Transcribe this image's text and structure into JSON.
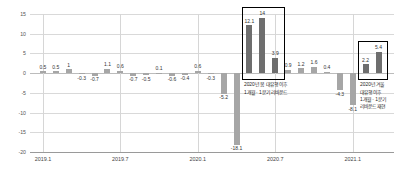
{
  "chart_data": {
    "type": "bar",
    "title": "",
    "subtitle": "",
    "xlabel": "",
    "ylabel": "",
    "ylim": [
      -20,
      15
    ],
    "yticks": [
      15,
      10,
      5,
      0,
      -5,
      -10,
      -15,
      -20
    ],
    "grid": true,
    "legend": false,
    "categories": [
      "2019.1",
      "2019.2",
      "2019.3",
      "2019.4",
      "2019.5",
      "2019.6",
      "2019.7",
      "2019.8",
      "2019.9",
      "2019.10",
      "2019.11",
      "2019.12",
      "2020.1",
      "2020.2",
      "2020.3",
      "2020.4",
      "2020.5",
      "2020.6",
      "2020.7",
      "2020.8",
      "2020.9",
      "2020.10",
      "2020.11",
      "2020.12",
      "2021.1",
      "2021.2",
      "2021.3"
    ],
    "values": [
      0.5,
      0.5,
      1,
      -0.3,
      -0.7,
      1.1,
      0.6,
      -0.7,
      -0.5,
      0.1,
      -0.6,
      -0.4,
      0.6,
      -0.3,
      -5.2,
      -18.1,
      12.1,
      14,
      3.9,
      0.9,
      1.2,
      1.6,
      0.4,
      -4.3,
      -8.1,
      2.2,
      5.4
    ],
    "xtick_labels": [
      "2019.1",
      "2019.7",
      "2020.1",
      "2020.7",
      "2021.1"
    ],
    "xtick_indices": [
      0,
      6,
      12,
      18,
      24
    ],
    "bar_colors": {
      "normal": "#a6a6a6",
      "highlight": "#6e6e6e"
    },
    "highlight_indices": [
      16,
      17,
      18,
      25,
      26
    ],
    "annotations": [
      {
        "id": "spring-rebound",
        "text": "2020년 봄 대유행 이후\n1개월 · 1분기 리바운드",
        "box_indices": [
          16,
          17,
          18
        ]
      },
      {
        "id": "winter-rebound",
        "text": "2020년 겨울\n대유행 이후\n1개월 · 1분기\n리바운드 재현",
        "box_indices": [
          25,
          26
        ]
      }
    ],
    "value_labels": [
      "0.5",
      "0.5",
      "1",
      "-0.3",
      "-0.7",
      "1.1",
      "0.6",
      "-0.7",
      "-0.5",
      "0.1",
      "-0.6",
      "-0.4",
      "0.6",
      "-0.3",
      "-5.2",
      "-18.1",
      "12.1",
      "14",
      "3.9",
      "0.9",
      "1.2",
      "1.6",
      "0.4",
      "-4.3",
      "-8.1",
      "2.2",
      "5.4"
    ]
  }
}
